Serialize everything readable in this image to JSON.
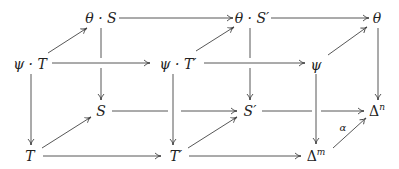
{
  "diagram": {
    "type": "commutative-cube",
    "nodes": {
      "thetaS": {
        "label": "θ · S"
      },
      "thetaSp": {
        "label": "θ · S′"
      },
      "theta": {
        "label": "θ"
      },
      "psiT": {
        "label": "ψ · T"
      },
      "psiTp": {
        "label": "ψ · T′"
      },
      "psi": {
        "label": "ψ"
      },
      "S": {
        "label": "S"
      },
      "Sp": {
        "label": "S′"
      },
      "DeltaN": {
        "base": "Δ",
        "sup": "n"
      },
      "T": {
        "label": "T"
      },
      "Tp": {
        "label": "T′"
      },
      "DeltaM": {
        "base": "Δ",
        "sup": "m"
      }
    },
    "edge_labels": {
      "alpha": "α"
    },
    "edges": [
      {
        "from": "θ · S",
        "to": "θ · S′"
      },
      {
        "from": "θ · S′",
        "to": "θ"
      },
      {
        "from": "ψ · T",
        "to": "ψ · T′"
      },
      {
        "from": "ψ · T′",
        "to": "ψ"
      },
      {
        "from": "S",
        "to": "S′"
      },
      {
        "from": "S′",
        "to": "Δⁿ"
      },
      {
        "from": "T",
        "to": "T′"
      },
      {
        "from": "T′",
        "to": "Δᵐ"
      },
      {
        "from": "ψ · T",
        "to": "θ · S"
      },
      {
        "from": "ψ · T′",
        "to": "θ · S′"
      },
      {
        "from": "ψ",
        "to": "θ"
      },
      {
        "from": "T",
        "to": "S"
      },
      {
        "from": "T′",
        "to": "S′"
      },
      {
        "from": "Δᵐ",
        "to": "Δⁿ",
        "label": "α"
      },
      {
        "from": "θ · S",
        "to": "S"
      },
      {
        "from": "θ · S′",
        "to": "S′"
      },
      {
        "from": "θ",
        "to": "Δⁿ"
      },
      {
        "from": "ψ · T",
        "to": "T"
      },
      {
        "from": "ψ · T′",
        "to": "T′"
      },
      {
        "from": "ψ",
        "to": "Δᵐ"
      }
    ]
  }
}
